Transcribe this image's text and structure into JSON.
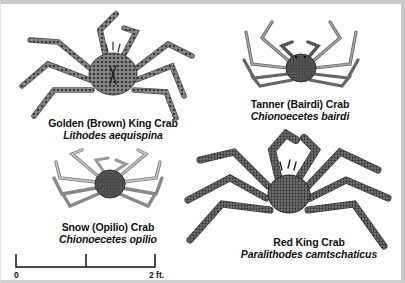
{
  "figure": {
    "background": "#ffffff",
    "border_color": "#c9c9c9",
    "ink_color": "#111111"
  },
  "crabs": [
    {
      "id": "golden-king-crab",
      "common_name": "Golden (Brown) King Crab",
      "scientific_name": "Lithodes aequispina",
      "icon": "spiny-king-crab-illustration"
    },
    {
      "id": "tanner-crab",
      "common_name": "Tanner (Bairdi) Crab",
      "scientific_name": "Chionoecetes bairdi",
      "icon": "tanner-crab-illustration"
    },
    {
      "id": "snow-crab",
      "common_name": "Snow (Opilio) Crab",
      "scientific_name": "Chionoecetes opilio",
      "icon": "snow-crab-illustration"
    },
    {
      "id": "red-king-crab",
      "common_name": "Red King Crab",
      "scientific_name": "Paralithodes camtschaticus",
      "icon": "red-king-crab-illustration"
    }
  ],
  "scale_bar": {
    "start_label": "0",
    "end_label": "2 ft.",
    "divisions": 2
  }
}
